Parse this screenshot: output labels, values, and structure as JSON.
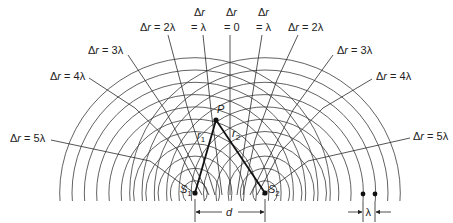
{
  "diagram": {
    "sources": [
      {
        "label": "S",
        "sub": "1",
        "x": 195,
        "y": 193
      },
      {
        "label": "S",
        "sub": "2",
        "x": 265,
        "y": 193
      }
    ],
    "wavelength_px": 12.3,
    "wavefront_count": 11,
    "point": {
      "label": "P"
    },
    "paths": {
      "r1_var": "r",
      "r1_sub": "1",
      "r2_var": "r",
      "r2_sub": "2"
    },
    "separation_label": "d",
    "wavelength_label": "λ",
    "nodal_labels": {
      "left_5": {
        "sym": "Δ",
        "var": "r",
        "rest": " = 5λ"
      },
      "left_4": {
        "sym": "Δ",
        "var": "r",
        "rest": " = 4λ"
      },
      "left_3": {
        "sym": "Δ",
        "var": "r",
        "rest": " = 3λ"
      },
      "left_2": {
        "sym": "Δ",
        "var": "r",
        "rest": " = 2λ"
      },
      "left_1": {
        "sym": "Δ",
        "var": "r",
        "rest": "= λ"
      },
      "center_0": {
        "sym": "Δ",
        "var": "r",
        "rest": "= 0"
      },
      "right_1": {
        "sym": "Δ",
        "var": "r",
        "rest": "= λ"
      },
      "right_2": {
        "sym": "Δ",
        "var": "r",
        "rest": " = 2λ"
      },
      "right_3": {
        "sym": "Δ",
        "var": "r",
        "rest": " = 3λ"
      },
      "right_4": {
        "sym": "Δ",
        "var": "r",
        "rest": " = 4λ"
      },
      "right_5": {
        "sym": "Δ",
        "var": "r",
        "rest": " = 5λ"
      }
    }
  }
}
